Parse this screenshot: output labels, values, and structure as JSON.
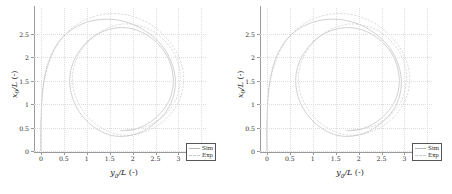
{
  "figure": {
    "panel_count": 2,
    "background": "#ffffff"
  },
  "axes": {
    "xlabel_symbol": "y",
    "xlabel_sub": "0",
    "xlabel_rest": "/L",
    "xlabel_unit": "(-)",
    "ylabel_symbol": "x",
    "ylabel_sub": "0",
    "ylabel_rest": "/L",
    "ylabel_unit": "(-)",
    "xticks": [
      "0",
      "0.5",
      "1",
      "1.5",
      "2",
      "2.5",
      "3",
      "3.5"
    ],
    "yticks": [
      "0",
      "0.5",
      "1",
      "1.5",
      "2",
      "2.5"
    ]
  },
  "legend": {
    "items": [
      {
        "label": "Sim",
        "style": "solid",
        "color": "#bdbdbd"
      },
      {
        "label": "Exp",
        "style": "dashed",
        "color": "#cccccc"
      }
    ]
  },
  "chart_data": {
    "type": "line",
    "title": "",
    "xlabel": "y0/L (-)",
    "ylabel": "x0/L (-)",
    "xlim": [
      -0.15,
      3.6
    ],
    "ylim": [
      0,
      3.05
    ],
    "xticks": [
      0,
      0.5,
      1,
      1.5,
      2,
      2.5,
      3,
      3.5
    ],
    "yticks": [
      0,
      0.5,
      1,
      1.5,
      2,
      2.5
    ],
    "grid": true,
    "legend_position": "lower-right",
    "panels": [
      {
        "name": "left-panel",
        "series": [
          {
            "name": "Sim",
            "style": "solid",
            "description": "turning-circle trajectory: rises along y0/L=0 from x0/L=0 to ~1.3, then curves right and loops clockwise, settling into a near-circular orbit centred near (1.75, 1.5) with radius ~1.2",
            "points": [
              [
                0.0,
                0.0
              ],
              [
                0.0,
                0.4
              ],
              [
                0.01,
                0.8
              ],
              [
                0.02,
                1.1
              ],
              [
                0.05,
                1.4
              ],
              [
                0.12,
                1.75
              ],
              [
                0.25,
                2.1
              ],
              [
                0.45,
                2.4
              ],
              [
                0.72,
                2.62
              ],
              [
                1.05,
                2.76
              ],
              [
                1.4,
                2.81
              ],
              [
                1.75,
                2.78
              ],
              [
                2.1,
                2.66
              ],
              [
                2.42,
                2.46
              ],
              [
                2.68,
                2.2
              ],
              [
                2.85,
                1.88
              ],
              [
                2.93,
                1.55
              ],
              [
                2.9,
                1.2
              ],
              [
                2.76,
                0.88
              ],
              [
                2.52,
                0.62
              ],
              [
                2.22,
                0.42
              ],
              [
                1.88,
                0.32
              ],
              [
                1.55,
                0.33
              ],
              [
                1.25,
                0.45
              ],
              [
                0.98,
                0.66
              ],
              [
                0.78,
                0.93
              ],
              [
                0.66,
                1.24
              ],
              [
                0.63,
                1.56
              ],
              [
                0.7,
                1.88
              ],
              [
                0.86,
                2.16
              ],
              [
                1.09,
                2.4
              ],
              [
                1.38,
                2.56
              ],
              [
                1.7,
                2.63
              ],
              [
                2.02,
                2.6
              ],
              [
                2.32,
                2.47
              ],
              [
                2.58,
                2.26
              ],
              [
                2.77,
                1.99
              ],
              [
                2.87,
                1.68
              ],
              [
                2.88,
                1.37
              ],
              [
                2.79,
                1.06
              ],
              [
                2.6,
                0.8
              ],
              [
                2.34,
                0.59
              ],
              [
                2.03,
                0.46
              ],
              [
                1.72,
                0.43
              ]
            ]
          },
          {
            "name": "Exp",
            "style": "dashed",
            "description": "experimental trajectory, slightly larger loop than Sim, same qualitative shape",
            "points": [
              [
                0.0,
                0.0
              ],
              [
                0.0,
                0.42
              ],
              [
                0.01,
                0.84
              ],
              [
                0.03,
                1.15
              ],
              [
                0.07,
                1.46
              ],
              [
                0.16,
                1.82
              ],
              [
                0.31,
                2.18
              ],
              [
                0.53,
                2.48
              ],
              [
                0.82,
                2.72
              ],
              [
                1.16,
                2.87
              ],
              [
                1.52,
                2.93
              ],
              [
                1.89,
                2.9
              ],
              [
                2.24,
                2.78
              ],
              [
                2.56,
                2.58
              ],
              [
                2.83,
                2.3
              ],
              [
                3.02,
                1.98
              ],
              [
                3.11,
                1.63
              ],
              [
                3.08,
                1.27
              ],
              [
                2.94,
                0.94
              ],
              [
                2.7,
                0.66
              ],
              [
                2.39,
                0.46
              ],
              [
                2.04,
                0.35
              ],
              [
                1.69,
                0.35
              ],
              [
                1.36,
                0.47
              ],
              [
                1.07,
                0.68
              ],
              [
                0.85,
                0.96
              ],
              [
                0.72,
                1.28
              ],
              [
                0.69,
                1.62
              ],
              [
                0.77,
                1.95
              ],
              [
                0.95,
                2.24
              ],
              [
                1.2,
                2.48
              ],
              [
                1.5,
                2.64
              ],
              [
                1.83,
                2.71
              ],
              [
                2.16,
                2.67
              ],
              [
                2.47,
                2.54
              ],
              [
                2.73,
                2.32
              ],
              [
                2.93,
                2.04
              ],
              [
                3.03,
                1.72
              ],
              [
                3.03,
                1.4
              ],
              [
                2.94,
                1.08
              ],
              [
                2.74,
                0.81
              ],
              [
                2.47,
                0.6
              ],
              [
                2.15,
                0.48
              ],
              [
                1.83,
                0.45
              ]
            ]
          }
        ]
      },
      {
        "name": "right-panel",
        "series": [
          {
            "name": "Sim",
            "style": "solid",
            "description": "turning-circle trajectory nearly identical to left panel",
            "points": [
              [
                0.0,
                0.0
              ],
              [
                0.0,
                0.4
              ],
              [
                0.01,
                0.8
              ],
              [
                0.02,
                1.1
              ],
              [
                0.05,
                1.4
              ],
              [
                0.12,
                1.75
              ],
              [
                0.25,
                2.1
              ],
              [
                0.45,
                2.4
              ],
              [
                0.72,
                2.62
              ],
              [
                1.05,
                2.76
              ],
              [
                1.4,
                2.81
              ],
              [
                1.75,
                2.78
              ],
              [
                2.1,
                2.66
              ],
              [
                2.42,
                2.46
              ],
              [
                2.68,
                2.2
              ],
              [
                2.85,
                1.88
              ],
              [
                2.93,
                1.55
              ],
              [
                2.9,
                1.2
              ],
              [
                2.76,
                0.88
              ],
              [
                2.52,
                0.62
              ],
              [
                2.22,
                0.42
              ],
              [
                1.88,
                0.32
              ],
              [
                1.55,
                0.33
              ],
              [
                1.25,
                0.45
              ],
              [
                0.98,
                0.66
              ],
              [
                0.78,
                0.93
              ],
              [
                0.66,
                1.24
              ],
              [
                0.63,
                1.56
              ],
              [
                0.7,
                1.88
              ],
              [
                0.86,
                2.16
              ],
              [
                1.09,
                2.4
              ],
              [
                1.38,
                2.56
              ],
              [
                1.7,
                2.63
              ],
              [
                2.02,
                2.6
              ],
              [
                2.32,
                2.47
              ],
              [
                2.58,
                2.26
              ],
              [
                2.77,
                1.99
              ],
              [
                2.87,
                1.68
              ],
              [
                2.88,
                1.37
              ],
              [
                2.79,
                1.06
              ],
              [
                2.6,
                0.8
              ],
              [
                2.34,
                0.59
              ],
              [
                2.03,
                0.46
              ],
              [
                1.72,
                0.43
              ]
            ]
          },
          {
            "name": "Exp",
            "style": "dashed",
            "description": "experimental trajectory, slightly larger loop than Sim",
            "points": [
              [
                0.0,
                0.0
              ],
              [
                0.0,
                0.42
              ],
              [
                0.01,
                0.84
              ],
              [
                0.03,
                1.15
              ],
              [
                0.07,
                1.46
              ],
              [
                0.16,
                1.82
              ],
              [
                0.31,
                2.18
              ],
              [
                0.53,
                2.48
              ],
              [
                0.82,
                2.72
              ],
              [
                1.16,
                2.87
              ],
              [
                1.52,
                2.93
              ],
              [
                1.89,
                2.9
              ],
              [
                2.24,
                2.78
              ],
              [
                2.56,
                2.58
              ],
              [
                2.83,
                2.3
              ],
              [
                3.02,
                1.98
              ],
              [
                3.11,
                1.63
              ],
              [
                3.08,
                1.27
              ],
              [
                2.94,
                0.94
              ],
              [
                2.7,
                0.66
              ],
              [
                2.39,
                0.46
              ],
              [
                2.04,
                0.35
              ],
              [
                1.69,
                0.35
              ],
              [
                1.36,
                0.47
              ],
              [
                1.07,
                0.68
              ],
              [
                0.85,
                0.96
              ],
              [
                0.72,
                1.28
              ],
              [
                0.69,
                1.62
              ],
              [
                0.77,
                1.95
              ],
              [
                0.95,
                2.24
              ],
              [
                1.2,
                2.48
              ],
              [
                1.5,
                2.64
              ],
              [
                1.83,
                2.71
              ],
              [
                2.16,
                2.67
              ],
              [
                2.47,
                2.54
              ],
              [
                2.73,
                2.32
              ],
              [
                2.93,
                2.04
              ],
              [
                3.03,
                1.72
              ],
              [
                3.03,
                1.4
              ],
              [
                2.94,
                1.08
              ],
              [
                2.74,
                0.81
              ],
              [
                2.47,
                0.6
              ],
              [
                2.15,
                0.48
              ],
              [
                1.83,
                0.45
              ]
            ]
          }
        ]
      }
    ]
  }
}
